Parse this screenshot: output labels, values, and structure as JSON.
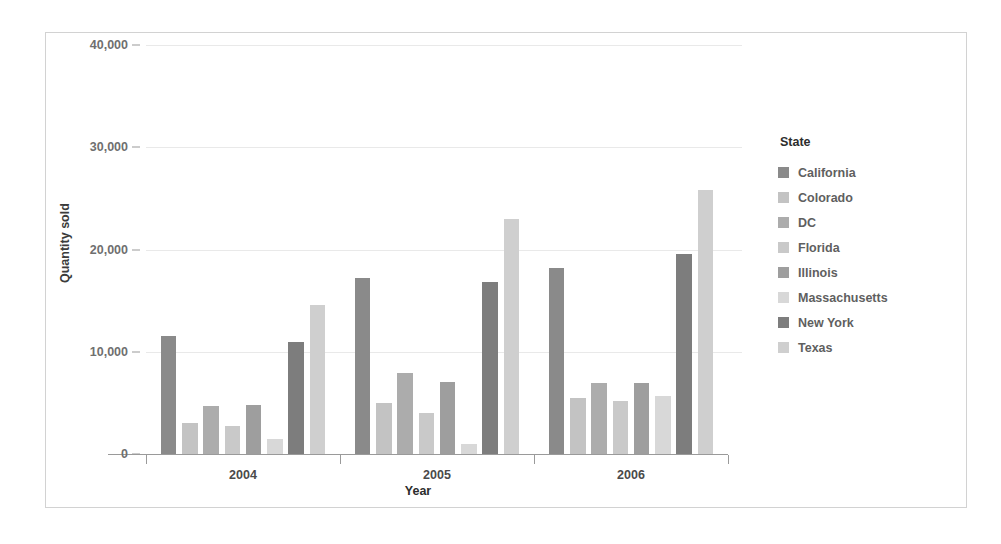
{
  "chart_data": {
    "type": "bar",
    "title": "",
    "subtitle": "",
    "xlabel": "Year",
    "ylabel": "Quantity sold",
    "categories": [
      "2004",
      "2005",
      "2006"
    ],
    "ylim": [
      0,
      40000
    ],
    "yticks": [
      0,
      10000,
      20000,
      30000,
      40000
    ],
    "ytick_labels": [
      "0",
      "10,000",
      "20,000",
      "30,000",
      "40,000"
    ],
    "grid": true,
    "legend_position": "right",
    "legend_title": "State",
    "grouping": "grouped",
    "series": [
      {
        "name": "California",
        "color": "#8a8a8a",
        "values": [
          11500,
          17200,
          18200
        ]
      },
      {
        "name": "Colorado",
        "color": "#c3c3c3",
        "values": [
          3000,
          5000,
          5500
        ]
      },
      {
        "name": "DC",
        "color": "#acacac",
        "values": [
          4700,
          7900,
          6900
        ]
      },
      {
        "name": "Florida",
        "color": "#c9c9c9",
        "values": [
          2700,
          4000,
          5200
        ]
      },
      {
        "name": "Illinois",
        "color": "#9e9e9e",
        "values": [
          4800,
          7000,
          6900
        ]
      },
      {
        "name": "Massachusetts",
        "color": "#d8d8d8",
        "values": [
          1500,
          1000,
          5700
        ]
      },
      {
        "name": "New York",
        "color": "#7d7d7d",
        "values": [
          11000,
          16800,
          19600
        ]
      },
      {
        "name": "Texas",
        "color": "#cfcfcf",
        "values": [
          14600,
          23000,
          25800
        ]
      }
    ]
  }
}
